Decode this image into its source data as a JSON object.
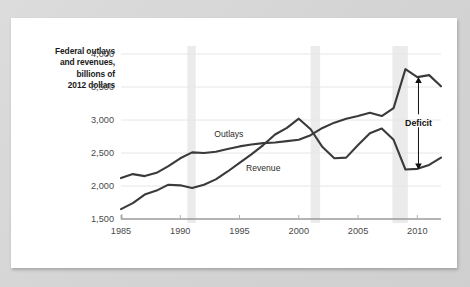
{
  "figure": {
    "axis_caption_lines": [
      "Federal outlays",
      "and revenues,",
      "billions of",
      "2012 dollars"
    ],
    "annotation": {
      "deficit_label": "Deficit"
    }
  },
  "chart_data": {
    "type": "line",
    "title": "",
    "subtitle": "",
    "xlabel": "",
    "ylabel": "Federal outlays and revenues, billions of 2012 dollars",
    "xlim": [
      1985,
      2012
    ],
    "ylim": [
      1500,
      4000
    ],
    "yticks": [
      1500,
      2000,
      2500,
      3000,
      3500,
      4000
    ],
    "ytick_labels": [
      "1,500",
      "2,000",
      "2,500",
      "3,000",
      "3,500",
      "4,000"
    ],
    "xticks": [
      1985,
      1990,
      1995,
      2000,
      2005,
      2010
    ],
    "xtick_labels": [
      "1985",
      "1990",
      "1995",
      "2000",
      "2005",
      "2010"
    ],
    "grid": true,
    "grid_axis": "y",
    "legend": "inline-labels",
    "line_color": "#3a3a3a",
    "grid_color": "#e6e6e6",
    "recession_band_color": "#ebebeb",
    "x": [
      1985,
      1986,
      1987,
      1988,
      1989,
      1990,
      1991,
      1992,
      1993,
      1994,
      1995,
      1996,
      1997,
      1998,
      1999,
      2000,
      2001,
      2002,
      2003,
      2004,
      2005,
      2006,
      2007,
      2008,
      2009,
      2010,
      2011,
      2012
    ],
    "series": [
      {
        "name": "Outlays",
        "label_x": 1994.1,
        "label_y": 2740,
        "values": [
          2120,
          2180,
          2150,
          2200,
          2300,
          2420,
          2510,
          2500,
          2520,
          2560,
          2600,
          2630,
          2650,
          2660,
          2680,
          2700,
          2770,
          2880,
          2960,
          3020,
          3060,
          3110,
          3060,
          3180,
          3770,
          3650,
          3680,
          3510
        ]
      },
      {
        "name": "Revenue",
        "label_x": 1997.0,
        "label_y": 2230,
        "values": [
          1650,
          1740,
          1870,
          1930,
          2020,
          2010,
          1970,
          2020,
          2100,
          2220,
          2350,
          2480,
          2620,
          2780,
          2880,
          3020,
          2860,
          2590,
          2420,
          2430,
          2620,
          2800,
          2870,
          2700,
          2250,
          2260,
          2320,
          2430
        ]
      }
    ],
    "recession_bands": [
      {
        "start": 1990.6,
        "end": 1991.3
      },
      {
        "start": 2001.0,
        "end": 2001.8
      },
      {
        "start": 2007.9,
        "end": 2009.2
      }
    ],
    "annotations": [
      {
        "text": "Deficit",
        "x": 2010.1,
        "y_top": 3650,
        "y_bottom": 2250,
        "type": "double-arrow"
      }
    ]
  }
}
